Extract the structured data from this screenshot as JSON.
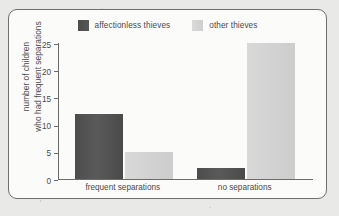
{
  "chart_data": {
    "type": "bar",
    "title": "",
    "xlabel": "",
    "ylabel_line1": "number of children",
    "ylabel_line2": "who had frequent separations",
    "categories": [
      "frequent separations",
      "no separations"
    ],
    "series": [
      {
        "name": "affectionless thieves",
        "values": [
          12,
          2
        ],
        "color": "#4f4f4f"
      },
      {
        "name": "other thieves",
        "values": [
          5,
          25
        ],
        "color": "#d4d4d4"
      }
    ],
    "ylim": [
      0,
      25
    ],
    "yticks": [
      0,
      5,
      10,
      15,
      20,
      25
    ],
    "ytick_labels": [
      "0",
      "5",
      "10",
      "15",
      "20",
      "25"
    ],
    "grid": false,
    "legend_position": "top-center"
  },
  "legend": {
    "items": [
      {
        "label": "affectionless thieves",
        "swatch": "legend-swatch-dark"
      },
      {
        "label": "other thieves",
        "swatch": "legend-swatch-light"
      }
    ]
  },
  "colors": {
    "page_background": "#e9e9e7",
    "panel_background": "#fbfbfa",
    "frame_border": "#6f6f6f",
    "axis": "#6b6b6b",
    "text": "#4a4a4a",
    "series_dark": "#4f4f4f",
    "series_light": "#d4d4d4"
  }
}
